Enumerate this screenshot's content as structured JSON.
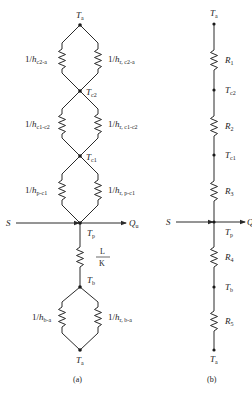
{
  "diagram_a": {
    "caption": "(a)",
    "nodes": {
      "ta_top": {
        "main": "T",
        "sub": "a"
      },
      "tc2": {
        "main": "T",
        "sub": "c2"
      },
      "tc1": {
        "main": "T",
        "sub": "c1"
      },
      "tp": {
        "main": "T",
        "sub": "p"
      },
      "tb": {
        "main": "T",
        "sub": "b"
      },
      "ta_bottom": {
        "main": "T",
        "sub": "a"
      }
    },
    "resistors": {
      "c2a_conv": {
        "prefix": "1/",
        "main": "h",
        "sub": "c2-a"
      },
      "c2a_rad": {
        "prefix": "1/",
        "main": "h",
        "sub": "r,  c2-a"
      },
      "c1c2_conv": {
        "prefix": "1/",
        "main": "h",
        "sub": "c1-c2"
      },
      "c1c2_rad": {
        "prefix": "1/",
        "main": "h",
        "sub": "r,  c1-c2"
      },
      "pc1_conv": {
        "prefix": "1/",
        "main": "h",
        "sub": "p-c1"
      },
      "pc1_rad": {
        "prefix": "1/",
        "main": "h",
        "sub": "r,  p-c1"
      },
      "lk": {
        "num": "L",
        "den": "K"
      },
      "ba_conv": {
        "prefix": "1/",
        "main": "h",
        "sub": "b-a"
      },
      "ba_rad": {
        "prefix": "1/",
        "main": "h",
        "sub": "r,  b-a"
      }
    },
    "source_in": "S",
    "flow_out": {
      "main": "Q",
      "sub": "u"
    }
  },
  "diagram_b": {
    "caption": "(b)",
    "nodes": {
      "ta_top": {
        "main": "T",
        "sub": "a"
      },
      "tc2": {
        "main": "T",
        "sub": "c2"
      },
      "tc1": {
        "main": "T",
        "sub": "c1"
      },
      "tp": {
        "main": "T",
        "sub": "p"
      },
      "tb": {
        "main": "T",
        "sub": "b"
      },
      "ta_bottom": {
        "main": "T",
        "sub": "a"
      }
    },
    "resistors": {
      "r1": {
        "main": "R",
        "sub": "1"
      },
      "r2": {
        "main": "R",
        "sub": "2"
      },
      "r3": {
        "main": "R",
        "sub": "3"
      },
      "r4": {
        "main": "R",
        "sub": "4"
      },
      "r5": {
        "main": "R",
        "sub": "5"
      }
    },
    "source_in": "S",
    "flow_out": {
      "main": "Q",
      "sub": "u"
    }
  }
}
